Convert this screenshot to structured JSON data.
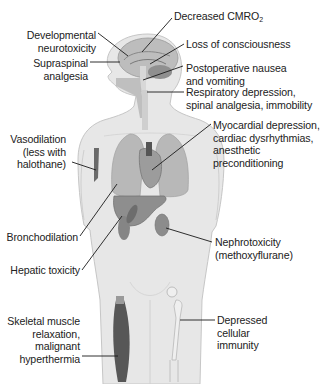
{
  "diagram": {
    "type": "anatomical-annotation",
    "colors": {
      "background": "#ffffff",
      "body_fill": "#e6e6e6",
      "body_outline": "#c4c4c4",
      "organ_fill": "#9a9a9a",
      "muscle_fill": "#5a5a5a",
      "text": "#222222",
      "leader_line": "#1a1a1a"
    }
  },
  "labels": {
    "cmro2": {
      "prefix": "Decreased CMRO",
      "subscript": "2"
    },
    "neurotox": {
      "line1": "Developmental",
      "line2": "neurotoxicity"
    },
    "consciousness": {
      "line1": "Loss of consciousness"
    },
    "supraspinal": {
      "line1": "Supraspinal",
      "line2": "analgesia"
    },
    "ponv": {
      "line1": "Postoperative nausea",
      "line2": "and vomiting"
    },
    "respiratory": {
      "line1": "Respiratory depression,",
      "line2": "spinal analgesia, immobility"
    },
    "vasodilation": {
      "line1": "Vasodilation",
      "line2": "(less with",
      "line3": "halothane)"
    },
    "myocardial": {
      "line1": "Myocardial depression,",
      "line2": "cardiac dysrhythmias,",
      "line3": "anesthetic",
      "line4": "preconditioning"
    },
    "bronchodilation": {
      "line1": "Bronchodilation"
    },
    "nephrotox": {
      "line1": "Nephrotoxicity",
      "line2": "(methoxyflurane)"
    },
    "hepatic": {
      "line1": "Hepatic toxicity"
    },
    "skeletal": {
      "line1": "Skeletal muscle",
      "line2": "relaxation,",
      "line3": "malignant",
      "line4": "hyperthermia"
    },
    "immunity": {
      "line1": "Depressed",
      "line2": "cellular",
      "line3": "immunity"
    }
  }
}
